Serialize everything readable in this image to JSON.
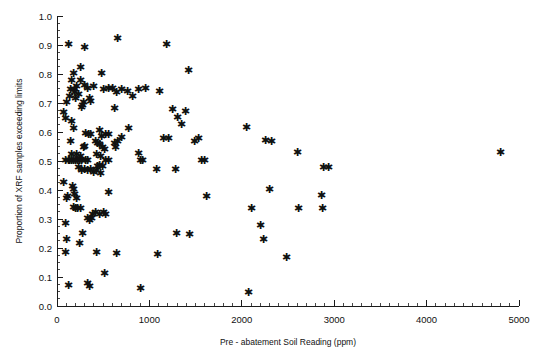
{
  "chart_data": {
    "type": "scatter",
    "title": "",
    "xlabel": "Pre - abatement Soil Reading (ppm)",
    "ylabel": "Proportion of XRF samples exceeding limits",
    "xlim": [
      0,
      5000
    ],
    "ylim": [
      0.0,
      1.0
    ],
    "grid": false,
    "legend": null,
    "marker": "asterisk",
    "marker_color": "#111111",
    "xticks": [
      0,
      1000,
      2000,
      3000,
      4000,
      5000
    ],
    "xtick_labels": [
      "0",
      "1000",
      "2000",
      "3000",
      "4000",
      "5000"
    ],
    "x_minor_tick_step": 100,
    "yticks": [
      0.0,
      0.1,
      0.2,
      0.3,
      0.4,
      0.5,
      0.6,
      0.7,
      0.8,
      0.9,
      1.0
    ],
    "ytick_labels": [
      "0.0",
      "0.1",
      "0.2",
      "0.3",
      "0.4",
      "0.5",
      "0.6",
      "0.7",
      "0.8",
      "0.9",
      "1.0"
    ],
    "y_minor_tick_step": 0.025,
    "n_points": 152,
    "points": [
      [
        120,
        0.9
      ],
      [
        300,
        0.89
      ],
      [
        660,
        0.92
      ],
      [
        1180,
        0.9
      ],
      [
        250,
        0.82
      ],
      [
        175,
        0.8
      ],
      [
        480,
        0.8
      ],
      [
        1420,
        0.81
      ],
      [
        160,
        0.775
      ],
      [
        300,
        0.76
      ],
      [
        400,
        0.755
      ],
      [
        560,
        0.75
      ],
      [
        700,
        0.745
      ],
      [
        880,
        0.745
      ],
      [
        150,
        0.745
      ],
      [
        185,
        0.735
      ],
      [
        330,
        0.75
      ],
      [
        1110,
        0.74
      ],
      [
        960,
        0.75
      ],
      [
        140,
        0.72
      ],
      [
        205,
        0.715
      ],
      [
        350,
        0.715
      ],
      [
        365,
        0.705
      ],
      [
        820,
        0.72
      ],
      [
        100,
        0.7
      ],
      [
        260,
        0.685
      ],
      [
        620,
        0.68
      ],
      [
        1250,
        0.675
      ],
      [
        1395,
        0.67
      ],
      [
        70,
        0.665
      ],
      [
        95,
        0.645
      ],
      [
        1300,
        0.65
      ],
      [
        155,
        0.635
      ],
      [
        1345,
        0.625
      ],
      [
        175,
        0.61
      ],
      [
        455,
        0.605
      ],
      [
        770,
        0.61
      ],
      [
        2050,
        0.615
      ],
      [
        310,
        0.595
      ],
      [
        340,
        0.59
      ],
      [
        365,
        0.59
      ],
      [
        480,
        0.585
      ],
      [
        520,
        0.59
      ],
      [
        555,
        0.59
      ],
      [
        1150,
        0.575
      ],
      [
        1205,
        0.575
      ],
      [
        2260,
        0.57
      ],
      [
        2320,
        0.565
      ],
      [
        420,
        0.565
      ],
      [
        440,
        0.56
      ],
      [
        455,
        0.555
      ],
      [
        620,
        0.56
      ],
      [
        660,
        0.565
      ],
      [
        4800,
        0.53
      ],
      [
        2600,
        0.53
      ],
      [
        880,
        0.525
      ],
      [
        160,
        0.52
      ],
      [
        215,
        0.52
      ],
      [
        250,
        0.515
      ],
      [
        430,
        0.52
      ],
      [
        470,
        0.515
      ],
      [
        95,
        0.5
      ],
      [
        120,
        0.5
      ],
      [
        140,
        0.5
      ],
      [
        160,
        0.5
      ],
      [
        180,
        0.5
      ],
      [
        200,
        0.5
      ],
      [
        220,
        0.5
      ],
      [
        240,
        0.5
      ],
      [
        265,
        0.5
      ],
      [
        310,
        0.5
      ],
      [
        335,
        0.5
      ],
      [
        530,
        0.5
      ],
      [
        560,
        0.5
      ],
      [
        900,
        0.5
      ],
      [
        930,
        0.5
      ],
      [
        1560,
        0.5
      ],
      [
        1600,
        0.5
      ],
      [
        2880,
        0.475
      ],
      [
        2940,
        0.475
      ],
      [
        1075,
        0.47
      ],
      [
        1280,
        0.47
      ],
      [
        230,
        0.475
      ],
      [
        265,
        0.465
      ],
      [
        295,
        0.47
      ],
      [
        330,
        0.465
      ],
      [
        365,
        0.47
      ],
      [
        400,
        0.46
      ],
      [
        430,
        0.465
      ],
      [
        470,
        0.455
      ],
      [
        75,
        0.425
      ],
      [
        165,
        0.41
      ],
      [
        175,
        0.4
      ],
      [
        2300,
        0.4
      ],
      [
        100,
        0.37
      ],
      [
        115,
        0.375
      ],
      [
        185,
        0.385
      ],
      [
        215,
        0.37
      ],
      [
        560,
        0.39
      ],
      [
        1620,
        0.375
      ],
      [
        2860,
        0.38
      ],
      [
        2100,
        0.335
      ],
      [
        2610,
        0.335
      ],
      [
        2870,
        0.335
      ],
      [
        175,
        0.34
      ],
      [
        200,
        0.335
      ],
      [
        225,
        0.335
      ],
      [
        255,
        0.335
      ],
      [
        380,
        0.315
      ],
      [
        420,
        0.32
      ],
      [
        455,
        0.315
      ],
      [
        500,
        0.32
      ],
      [
        530,
        0.315
      ],
      [
        330,
        0.3
      ],
      [
        350,
        0.295
      ],
      [
        375,
        0.3
      ],
      [
        90,
        0.285
      ],
      [
        2200,
        0.275
      ],
      [
        275,
        0.25
      ],
      [
        1295,
        0.25
      ],
      [
        1430,
        0.245
      ],
      [
        100,
        0.23
      ],
      [
        2230,
        0.23
      ],
      [
        240,
        0.215
      ],
      [
        95,
        0.185
      ],
      [
        430,
        0.185
      ],
      [
        640,
        0.18
      ],
      [
        2480,
        0.165
      ],
      [
        1090,
        0.175
      ],
      [
        515,
        0.11
      ],
      [
        120,
        0.07
      ],
      [
        330,
        0.075
      ],
      [
        355,
        0.065
      ],
      [
        905,
        0.06
      ],
      [
        2075,
        0.045
      ],
      [
        250,
        0.775
      ],
      [
        215,
        0.755
      ],
      [
        190,
        0.745
      ],
      [
        235,
        0.73
      ],
      [
        505,
        0.745
      ],
      [
        605,
        0.75
      ],
      [
        275,
        0.69
      ],
      [
        290,
        0.7
      ],
      [
        640,
        0.735
      ],
      [
        760,
        0.74
      ],
      [
        1485,
        0.565
      ],
      [
        1530,
        0.575
      ],
      [
        495,
        0.545
      ],
      [
        510,
        0.54
      ],
      [
        285,
        0.545
      ],
      [
        300,
        0.55
      ],
      [
        635,
        0.545
      ],
      [
        440,
        0.48
      ],
      [
        460,
        0.485
      ],
      [
        490,
        0.48
      ],
      [
        145,
        0.565
      ],
      [
        700,
        0.58
      ]
    ]
  }
}
